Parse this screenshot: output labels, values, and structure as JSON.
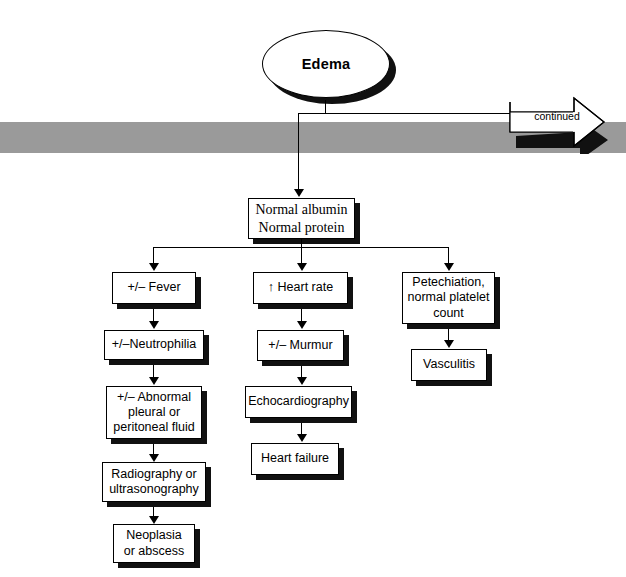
{
  "diagram": {
    "root": {
      "label": "Edema",
      "shape": "ellipse"
    },
    "band": {
      "color": "#9a9a9a"
    },
    "continued": {
      "label": "continued",
      "icon": "right-block-arrow"
    },
    "stem": {
      "label": "Normal albumin\nNormal protein",
      "line1": "Normal albumin",
      "line2": "Normal protein"
    },
    "branches": [
      {
        "id": "fever-branch",
        "nodes": [
          {
            "label": "+/– Fever"
          },
          {
            "label": "+/–Neutrophilia"
          },
          {
            "label": "+/– Abnormal\npleural or\nperitoneal fluid",
            "line1": "+/– Abnormal",
            "line2": "pleural or",
            "line3": "peritoneal fluid"
          },
          {
            "label": "Radiography or\nultrasonography",
            "line1": "Radiography or",
            "line2": "ultrasonography"
          },
          {
            "label": "Neoplasia\nor abscess",
            "line1": "Neoplasia",
            "line2": "or abscess"
          }
        ]
      },
      {
        "id": "heart-rate-branch",
        "nodes": [
          {
            "label": "↑ Heart rate"
          },
          {
            "label": "+/– Murmur"
          },
          {
            "label": "Echocardiography"
          },
          {
            "label": "Heart failure"
          }
        ]
      },
      {
        "id": "petechiation-branch",
        "nodes": [
          {
            "label": "Petechiation,\nnormal platelet\ncount",
            "line1": "Petechiation,",
            "line2": "normal platelet",
            "line3": "count"
          },
          {
            "label": "Vasculitis"
          }
        ]
      }
    ]
  }
}
